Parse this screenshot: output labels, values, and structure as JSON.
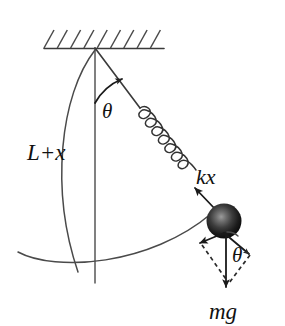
{
  "figure": {
    "background_color": "#ffffff",
    "line_color": "#3a3a3a",
    "ink_color": "#1a1a1a",
    "labels": {
      "length": "L+x",
      "spring_force": "kx",
      "weight": "mg",
      "angle_pivot": "θ",
      "angle_ball": "θ"
    },
    "elements": {
      "ceiling": "hatched-support",
      "pivot": "pivot-point",
      "rod": "rod-segment",
      "spring": "coil-spring",
      "bob": "pendulum-bob",
      "swing_arc": "swing-path-arc",
      "length_brace": "length-brace-arc",
      "vertical_reference": "vertical-reference-line",
      "weight_vector": "weight-vector",
      "tangential_component": "tangential-component-vector",
      "radial_component": "radial-component-vector",
      "component_box": "component-parallelogram"
    },
    "geometry": {
      "pivot_x": 95,
      "pivot_y": 48,
      "bob_center_x": 224,
      "bob_center_y": 221,
      "bob_radius": 17,
      "ceiling_y": 48,
      "ceiling_left": 44,
      "ceiling_right": 164,
      "hatch_count": 9,
      "spring_coils": 7,
      "angle_degrees": 35
    }
  }
}
